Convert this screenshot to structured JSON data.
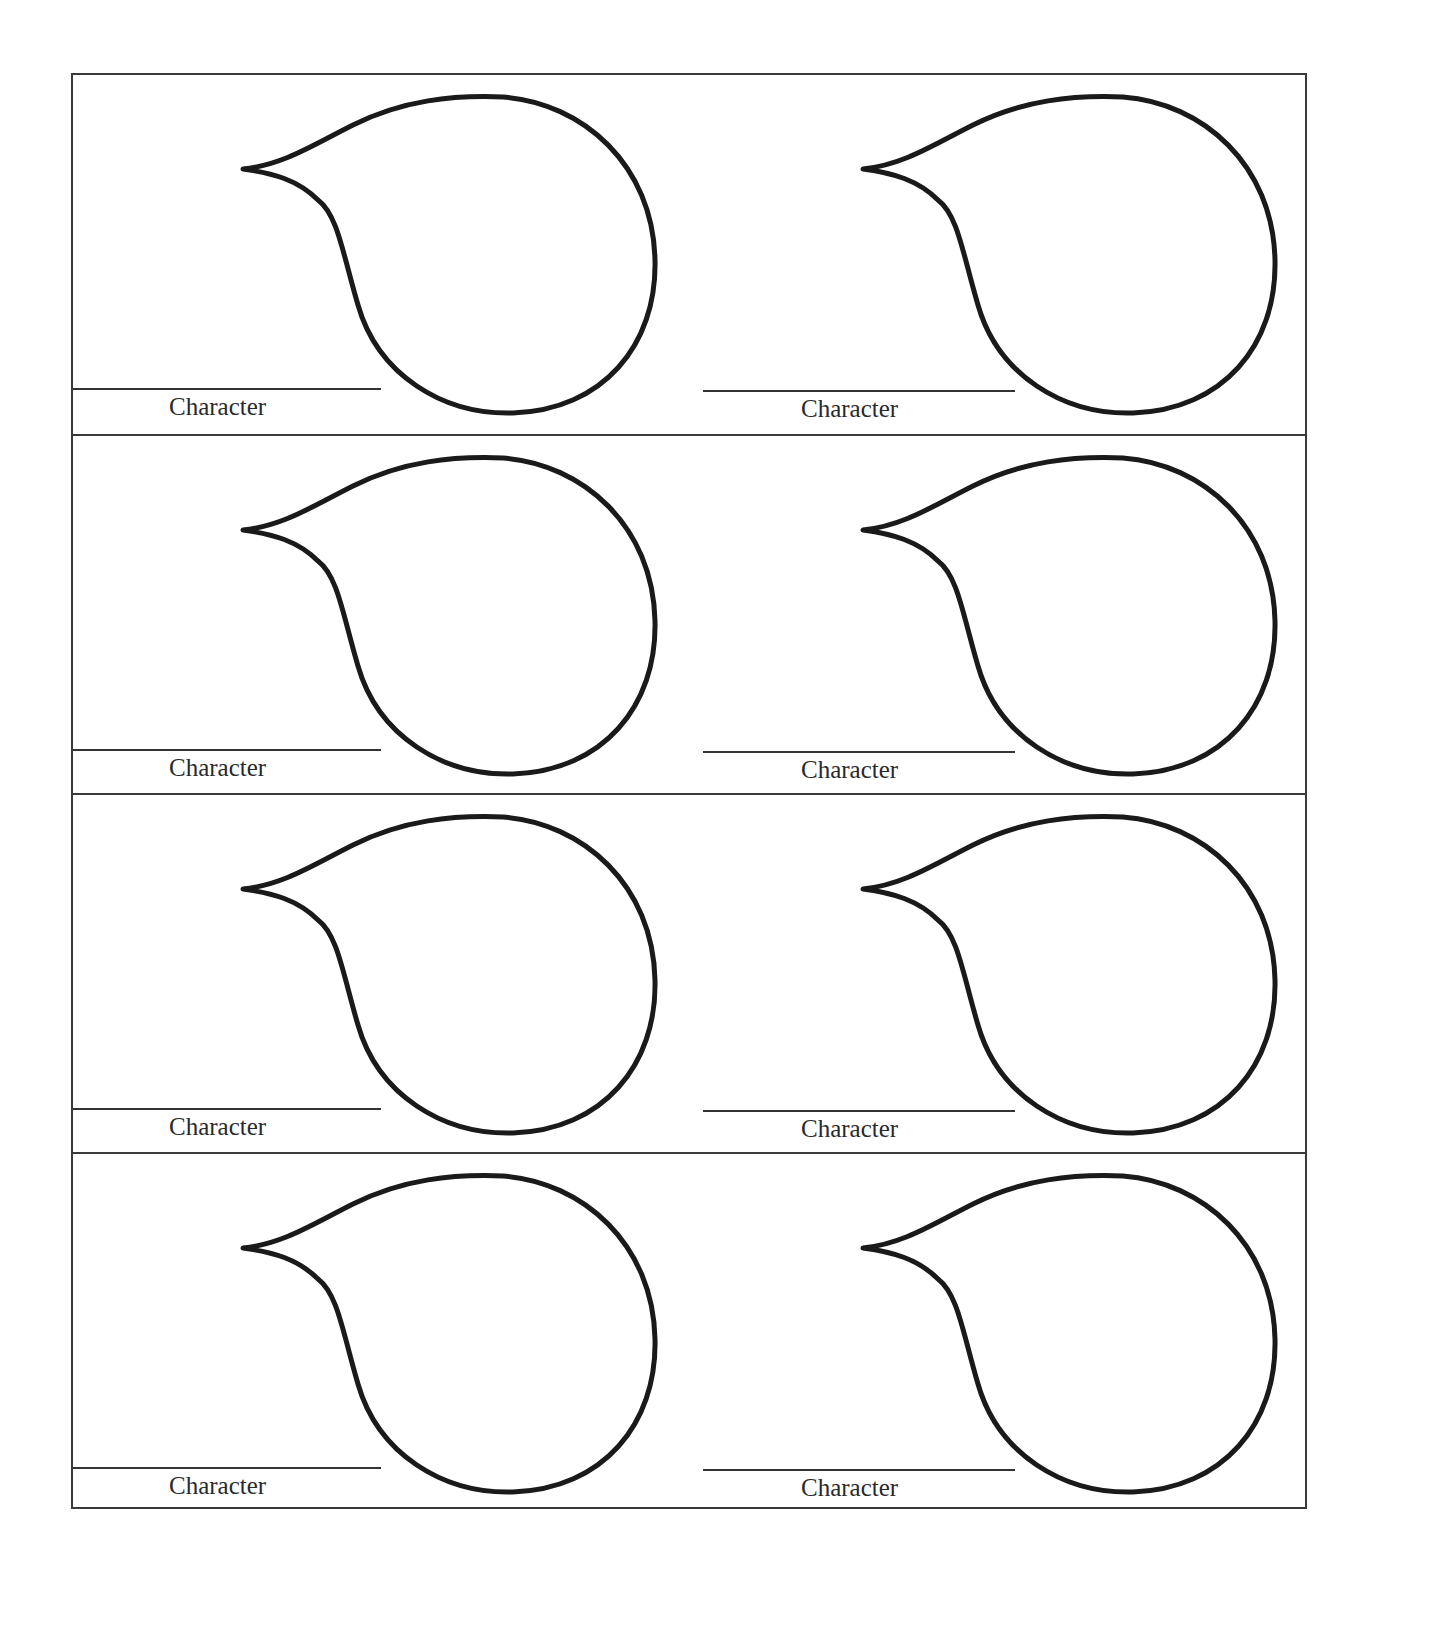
{
  "worksheet": {
    "layout": {
      "rows": 4,
      "columns": 2
    },
    "border_color": "#3a3a3a",
    "stroke_color": "#1a1a1a",
    "cells": [
      {
        "row": 1,
        "column": 1,
        "label": "Character",
        "shape": "speech-bubble"
      },
      {
        "row": 1,
        "column": 2,
        "label": "Character",
        "shape": "speech-bubble"
      },
      {
        "row": 2,
        "column": 1,
        "label": "Character",
        "shape": "speech-bubble"
      },
      {
        "row": 2,
        "column": 2,
        "label": "Character",
        "shape": "speech-bubble"
      },
      {
        "row": 3,
        "column": 1,
        "label": "Character",
        "shape": "speech-bubble"
      },
      {
        "row": 3,
        "column": 2,
        "label": "Character",
        "shape": "speech-bubble"
      },
      {
        "row": 4,
        "column": 1,
        "label": "Character",
        "shape": "speech-bubble"
      },
      {
        "row": 4,
        "column": 2,
        "label": "Character",
        "shape": "speech-bubble"
      }
    ]
  }
}
